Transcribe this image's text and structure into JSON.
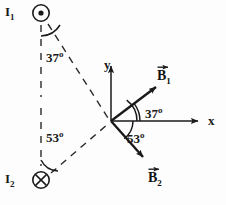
{
  "figure": {
    "background_color": "#fdfdfd",
    "stroke_color": "#1a1a1a"
  },
  "axes": {
    "x_label": "x",
    "y_label": "y",
    "origin": {
      "x": 111,
      "y": 121
    }
  },
  "currents": [
    {
      "id": "I1",
      "label": "I",
      "subscript": "1",
      "symbol": "dot-out-of-page",
      "position": {
        "x": 41,
        "y": 13
      }
    },
    {
      "id": "I2",
      "label": "I",
      "subscript": "2",
      "symbol": "cross-into-page",
      "position": {
        "x": 41,
        "y": 180
      }
    }
  ],
  "vectors": [
    {
      "id": "B1",
      "label": "B",
      "subscript": "1",
      "direction": "up-right",
      "tip": {
        "x": 158,
        "y": 86
      }
    },
    {
      "id": "B2",
      "label": "B",
      "subscript": "2",
      "direction": "down-right",
      "tip": {
        "x": 146,
        "y": 160
      }
    }
  ],
  "angles": [
    {
      "id": "angle-i1",
      "value": "37",
      "unit": "o",
      "at": "I1",
      "between": "vertical-dashed and line-to-origin"
    },
    {
      "id": "angle-i2",
      "value": "53",
      "unit": "o",
      "at": "I2",
      "between": "vertical-dashed and line-to-origin"
    },
    {
      "id": "angle-b1",
      "value": "37",
      "unit": "o",
      "at": "origin",
      "between": "x-axis and B1"
    },
    {
      "id": "angle-b2",
      "value": "53",
      "unit": "o",
      "at": "origin",
      "between": "x-axis and B2"
    }
  ]
}
